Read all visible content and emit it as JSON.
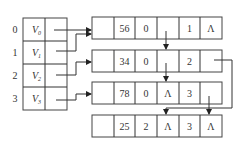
{
  "vertex_table": {
    "rows": [
      {
        "index": "0",
        "vertex": "V",
        "sub": "0"
      },
      {
        "index": "1",
        "vertex": "V",
        "sub": "1"
      },
      {
        "index": "2",
        "vertex": "V",
        "sub": "2"
      },
      {
        "index": "3",
        "vertex": "V",
        "sub": "3"
      }
    ]
  },
  "edge_nodes": [
    {
      "cells": [
        "",
        "56",
        "0",
        "",
        "1",
        "Λ"
      ]
    },
    {
      "cells": [
        "",
        "34",
        "0",
        "",
        "2",
        ""
      ]
    },
    {
      "cells": [
        "",
        "78",
        "0",
        "Λ",
        "3",
        ""
      ]
    },
    {
      "cells": [
        "",
        "25",
        "2",
        "Λ",
        "3",
        "Λ"
      ]
    }
  ]
}
